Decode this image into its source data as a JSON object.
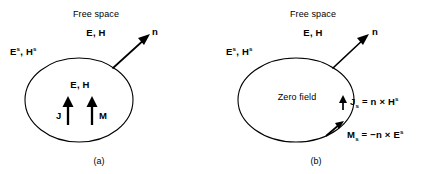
{
  "figure": {
    "background_color": "#ffffff",
    "stroke_color": "#000000",
    "panels": [
      {
        "id": "a",
        "caption": "(a)",
        "outside_region_label": "Free space",
        "outside_field_label": "E, H",
        "scattered_field_label_base": "E",
        "scattered_field_label_sup": "s",
        "scattered_field_label_base2": "H",
        "scattered_field_label_sup2": "s",
        "scattered_field_label_sep": ", ",
        "normal_vector_label": "n",
        "interior_field_label": "E, H",
        "current_j_label": "J",
        "current_m_label": "M"
      },
      {
        "id": "b",
        "caption": "(b)",
        "outside_region_label": "Free space",
        "outside_field_label": "E, H",
        "scattered_field_label_base": "E",
        "scattered_field_label_sup": "s",
        "scattered_field_label_base2": "H",
        "scattered_field_label_sup2": "s",
        "scattered_field_label_sep": ", ",
        "normal_vector_label": "n",
        "interior_field_label": "Zero field",
        "equation_js": {
          "symbol": "J",
          "subscript": "s",
          "equals": " = ",
          "rhs_n": "n",
          "cross": " × ",
          "rhs_field": "H",
          "rhs_sup": "s"
        },
        "equation_ms": {
          "symbol": "M",
          "subscript": "s",
          "equals": " = ",
          "minus": "−",
          "rhs_n": "n",
          "cross": " × ",
          "rhs_field": "E",
          "rhs_sup": "s"
        }
      }
    ]
  }
}
